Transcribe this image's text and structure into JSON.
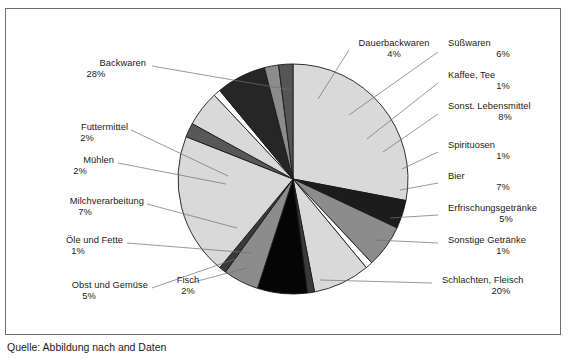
{
  "figure": {
    "caption": "Quelle: Abbildung nach and Daten"
  },
  "chart_data": {
    "type": "pie",
    "title": "",
    "xlabel": "",
    "ylabel": "",
    "grid": false,
    "legend_position": "none",
    "label_format": "name + percent",
    "center": {
      "x": 293,
      "y": 179
    },
    "radius": 115,
    "start_angle_deg": -90,
    "direction": "clockwise",
    "categories": [
      "Backwaren",
      "Dauerbackwaren",
      "Süßwaren",
      "Kaffee, Tee",
      "Sonst. Lebensmittel",
      "Spirituosen",
      "Bier",
      "Erfrischungsgetränke",
      "Sonstige Getränke",
      "Schlachten, Fleisch",
      "Fisch",
      "Obst und Gemüse",
      "Öle und Fette",
      "Milchverarbeitung",
      "Mühlen",
      "Futtermittel"
    ],
    "values": [
      28,
      4,
      6,
      1,
      8,
      1,
      7,
      5,
      1,
      20,
      2,
      5,
      1,
      7,
      2,
      2
    ],
    "units": "percent",
    "total": 100,
    "slice_fills": [
      "#d9d9d9",
      "#1c1c1c",
      "#8c8c8c",
      "#ffffff",
      "#d9d9d9",
      "#3a3a3a",
      "#050505",
      "#8c8c8c",
      "#3a3a3a",
      "#d9d9d9",
      "#585858",
      "#d9d9d9",
      "#ffffff",
      "#262626",
      "#8c8c8c",
      "#555555"
    ],
    "slice_stroke": "#1a1a1a"
  },
  "labels": [
    {
      "name": "Backwaren",
      "pct": "28%"
    },
    {
      "name": "Futtermittel",
      "pct": "2%"
    },
    {
      "name": "Mühlen",
      "pct": "2%"
    },
    {
      "name": "Milchverarbeitung",
      "pct": "7%"
    },
    {
      "name": "Öle und Fette",
      "pct": "1%"
    },
    {
      "name": "Obst und Gemüse",
      "pct": "5%"
    },
    {
      "name": "Fisch",
      "pct": "2%"
    },
    {
      "name": "Dauerbackwaren",
      "pct": "4%"
    },
    {
      "name": "Süßwaren",
      "pct": "6%"
    },
    {
      "name": "Kaffee, Tee",
      "pct": "1%"
    },
    {
      "name": "Sonst. Lebensmittel",
      "pct": "8%"
    },
    {
      "name": "Spirituosen",
      "pct": "1%"
    },
    {
      "name": "Bier",
      "pct": "7%"
    },
    {
      "name": "Erfrischungsgetränke",
      "pct": "5%"
    },
    {
      "name": "Sonstige Getränke",
      "pct": "1%"
    },
    {
      "name": "Schlachten, Fleisch",
      "pct": "20%"
    }
  ]
}
